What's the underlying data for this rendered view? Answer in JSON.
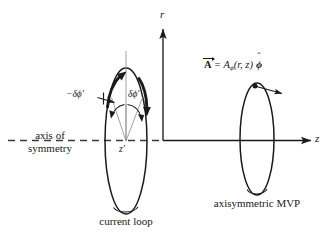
{
  "figure": {
    "background": "#ffffff",
    "ink": "#1a1a1a",
    "width": 336,
    "height": 242
  },
  "axes": {
    "vertical_label": "r",
    "horizontal_label": "z",
    "origin": {
      "x": 163,
      "y": 140
    }
  },
  "symmetry": {
    "line_label_1": "axis of",
    "line_label_2": "symmetry",
    "style": "dashed"
  },
  "left_loop": {
    "caption": "current loop",
    "center_label": "z′",
    "angle_label_positive": "δϕ′",
    "angle_label_negative": "−δϕ′",
    "center": {
      "x": 126,
      "y": 141
    },
    "rx": 21,
    "ry": 73
  },
  "right_loop": {
    "caption": "axisymmetric MVP",
    "center": {
      "x": 257,
      "y": 139
    },
    "rx": 17,
    "ry": 56,
    "point": {
      "x": 255,
      "y": 86
    }
  },
  "equation": {
    "vector_symbol": "A",
    "equals": "=",
    "component_symbol": "A",
    "component_subscript": "ϕ",
    "arguments": "(r, z)",
    "unit_vector": "ϕ",
    "hat": "ˆ",
    "full_text": "A⃗ = Aϕ(r, z) ϕ̂"
  },
  "icons": {
    "arrowhead": "arrowhead-icon",
    "dot": "point-marker-icon"
  }
}
